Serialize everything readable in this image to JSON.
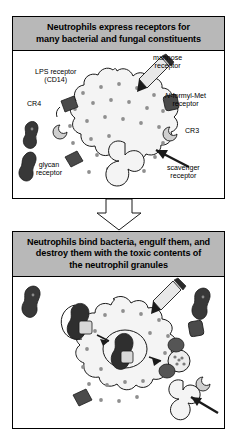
{
  "figure": {
    "type": "diagram",
    "panels": [
      {
        "id": "top",
        "title": "Neutrophils express receptors for many bacterial and fungal constituents",
        "title_lines": [
          "Neutrophils express receptors for",
          "many bacterial and fungal constituents"
        ],
        "labels": [
          {
            "id": "lps",
            "text_lines": [
              "LPS  receptor",
              "(CD14)"
            ]
          },
          {
            "id": "mannose",
            "text_lines": [
              "mannose",
              "receptor"
            ]
          },
          {
            "id": "cr4",
            "text_lines": [
              "CR4"
            ]
          },
          {
            "id": "nformyl",
            "text_lines": [
              "N-formyl-Met",
              "receptor"
            ],
            "italic_prefix": "N"
          },
          {
            "id": "cr3",
            "text_lines": [
              "CR3"
            ]
          },
          {
            "id": "scavenger",
            "text_lines": [
              "scavenger",
              "receptor"
            ]
          },
          {
            "id": "glycan",
            "text_lines": [
              "glycan",
              "receptor"
            ]
          }
        ]
      },
      {
        "id": "bottom",
        "title": "Neutrophils bind bacteria, engulf them, and destroy them with the toxic contents of the neutrophil granules",
        "title_lines": [
          "Neutrophils bind bacteria, engulf them, and",
          "destroy them with the toxic contents of",
          "the neutrophil granules"
        ],
        "labels": []
      }
    ],
    "connector": {
      "id": "down-arrow",
      "direction": "down"
    },
    "colors": {
      "header_gray": "#b8b8b8",
      "panel_border": "#000000",
      "cell_fill": "#f4f4f4",
      "granule": "#9a9a9a",
      "bacteria_dark": "#3a3a3a",
      "receptor_gray": "#6d6d6d",
      "page_background": "#ffffff"
    }
  }
}
